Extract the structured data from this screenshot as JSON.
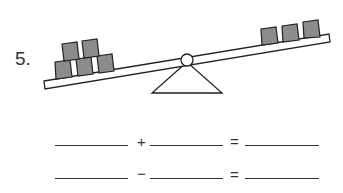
{
  "problem": {
    "number": "5.",
    "left_side": {
      "blocks": 5,
      "arrangement": "3 bottom, 2 top"
    },
    "right_side": {
      "blocks": 3,
      "arrangement": "3 in a row"
    },
    "block_color": "#8c8c8c"
  },
  "equations": [
    {
      "operator": "+",
      "equals": "="
    },
    {
      "operator": "−",
      "equals": "="
    }
  ]
}
